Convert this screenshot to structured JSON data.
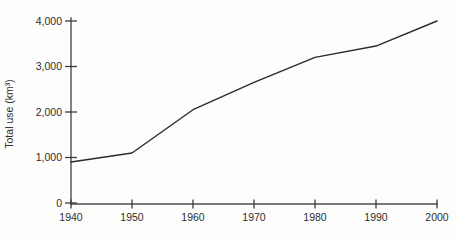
{
  "chart_data": {
    "type": "line",
    "title": "",
    "xlabel": "",
    "ylabel": "Total use (km³)",
    "categories": [
      "1940",
      "1950",
      "1960",
      "1970",
      "1980",
      "1990",
      "2000"
    ],
    "values": [
      900,
      1100,
      2050,
      2650,
      3200,
      3450,
      4000
    ],
    "ylim": [
      0,
      4000
    ],
    "y_ticks": [
      0,
      1000,
      2000,
      3000,
      4000
    ],
    "y_tick_labels": [
      "0",
      "1,000",
      "2,000",
      "3,000",
      "4,000"
    ],
    "grid": false,
    "legend": "none",
    "line_color": "#2b2b2b",
    "axis_color": "#4d4d4d",
    "text_color": "#2e2e2e",
    "background": "#fdfdfc"
  }
}
